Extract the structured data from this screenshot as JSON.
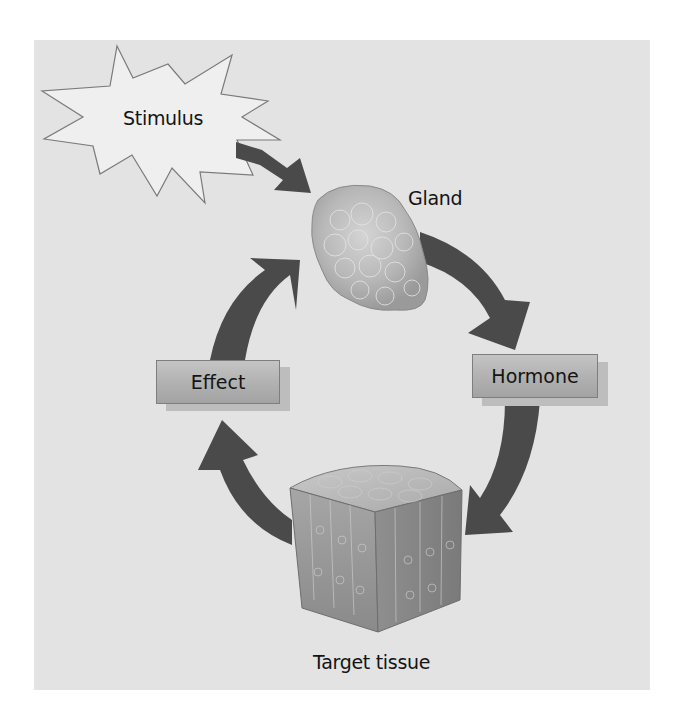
{
  "diagram": {
    "type": "cycle",
    "title": "",
    "background_color": "#e3e3e3",
    "arrow_color": "#4a4a4a",
    "nodes": {
      "stimulus": {
        "label": "Stimulus",
        "shape": "starburst"
      },
      "gland": {
        "label": "Gland",
        "shape": "illustration"
      },
      "hormone": {
        "label": "Hormone",
        "shape": "box"
      },
      "target_tissue": {
        "label": "Target tissue",
        "shape": "illustration"
      },
      "effect": {
        "label": "Effect",
        "shape": "box"
      }
    },
    "edges": [
      {
        "from": "Stimulus",
        "to": "Gland"
      },
      {
        "from": "Gland",
        "to": "Hormone"
      },
      {
        "from": "Hormone",
        "to": "Target tissue"
      },
      {
        "from": "Target tissue",
        "to": "Effect"
      },
      {
        "from": "Effect",
        "to": "Gland"
      }
    ]
  }
}
